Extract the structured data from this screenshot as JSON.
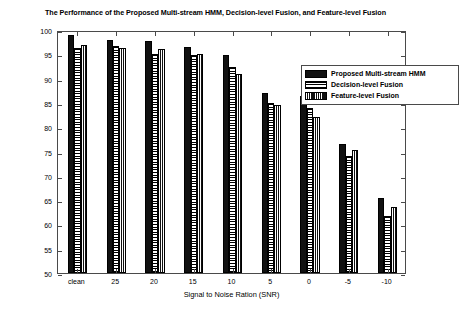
{
  "chart_data": {
    "type": "bar",
    "title": "The Performance of the Proposed Multi-stream HMM, Decision-level Fusion, and Feature-level Fusion",
    "xlabel": "Signal to Noise Ration (SNR)",
    "ylabel": "Recognition Rate",
    "categories": [
      "clean",
      "25",
      "20",
      "15",
      "10",
      "5",
      "0",
      "-5",
      "-10"
    ],
    "ylim": [
      50,
      100
    ],
    "yticks": [
      50,
      55,
      60,
      65,
      70,
      75,
      80,
      85,
      90,
      95,
      100
    ],
    "grid": false,
    "legend_position": "upper right",
    "series": [
      {
        "name": "Proposed Multi-stream HMM",
        "fill": "solid-black",
        "values": [
          99.0,
          98.0,
          97.8,
          96.5,
          94.8,
          87.0,
          86.5,
          76.5,
          65.5
        ]
      },
      {
        "name": "Decision-level Fusion",
        "fill": "horizontal-lines",
        "values": [
          96.3,
          96.8,
          95.1,
          94.9,
          92.4,
          85.0,
          84.0,
          74.0,
          61.8
        ]
      },
      {
        "name": "Feature-level Fusion",
        "fill": "vertical-lines",
        "values": [
          97.0,
          96.4,
          96.0,
          95.1,
          91.0,
          84.5,
          82.0,
          75.3,
          63.5
        ]
      }
    ]
  },
  "colors": {
    "axis": "#4a4a4a",
    "series_0": "#111111",
    "series_1": "#ffffff",
    "series_2": "#101010",
    "background": "#ffffff"
  }
}
